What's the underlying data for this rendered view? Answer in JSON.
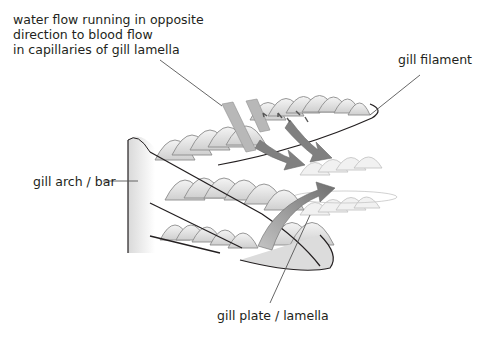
{
  "diagram": {
    "labels": {
      "water_flow": {
        "lines": [
          "water flow running in opposite",
          "direction to blood flow",
          "in capillaries of gill lamella"
        ]
      },
      "gill_filament": "gill filament",
      "gill_arch": "gill arch / bar",
      "gill_plate": "gill plate / lamella"
    },
    "colors": {
      "outline": "#231f20",
      "lamella_fill": "#e6e6e6",
      "lamella_stroke": "#8c8c8c",
      "water_arrow": "#a8a8a8",
      "blood_arrow": "#7a7a7a",
      "leader_line": "#555555"
    }
  }
}
